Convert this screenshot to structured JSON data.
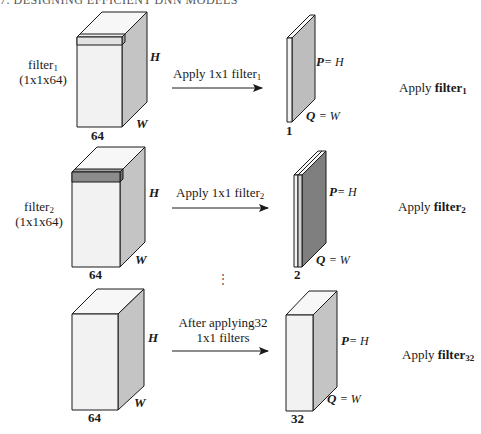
{
  "header": {
    "text": "7. DESIGNING EFFICIENT DNN MODELS"
  },
  "colors": {
    "face_front": "#f2f2f2",
    "face_top": "#f7f7f7",
    "face_side": "#c4c4c4",
    "filter1_slab": "#e6e6e6",
    "filter2_slab": "#8c8c8c",
    "output_slab1": "#bdbdbd",
    "output_slab2": "#7f7f7f",
    "stroke": "#1a1a1a"
  },
  "rows": [
    {
      "filter_label": {
        "name": "filter",
        "sub": "1",
        "dims": "(1x1x64)"
      },
      "input": {
        "depth_label": "64",
        "height_label": "H",
        "width_label": "W"
      },
      "arrow": {
        "text": "Apply 1x1 filter",
        "sub": "1"
      },
      "output": {
        "depth_label": "1",
        "p_label": "P",
        "p_eq": "= H",
        "q_label": "Q",
        "q_eq": "= W"
      },
      "caption": {
        "prefix": "Apply ",
        "bold": "filter",
        "sub": "1"
      }
    },
    {
      "filter_label": {
        "name": "filter",
        "sub": "2",
        "dims": "(1x1x64)"
      },
      "input": {
        "depth_label": "64",
        "height_label": "H",
        "width_label": "W"
      },
      "arrow": {
        "text": "Apply 1x1 filter",
        "sub": "2"
      },
      "output": {
        "depth_label": "2",
        "p_label": "P",
        "p_eq": "= H",
        "q_label": "Q",
        "q_eq": "= W"
      },
      "caption": {
        "prefix": "Apply ",
        "bold": "filter",
        "sub": "2"
      }
    },
    {
      "input": {
        "depth_label": "64",
        "height_label": "H",
        "width_label": "W"
      },
      "arrow": {
        "line1": "After applying32",
        "line2": "1x1 filters"
      },
      "output": {
        "depth_label": "32",
        "p_label": "P",
        "p_eq": "= H",
        "q_label": "Q",
        "q_eq": "= W"
      },
      "caption": {
        "prefix": "Apply ",
        "bold": "filter",
        "sub": "32"
      }
    }
  ],
  "ellipsis": "⋮"
}
